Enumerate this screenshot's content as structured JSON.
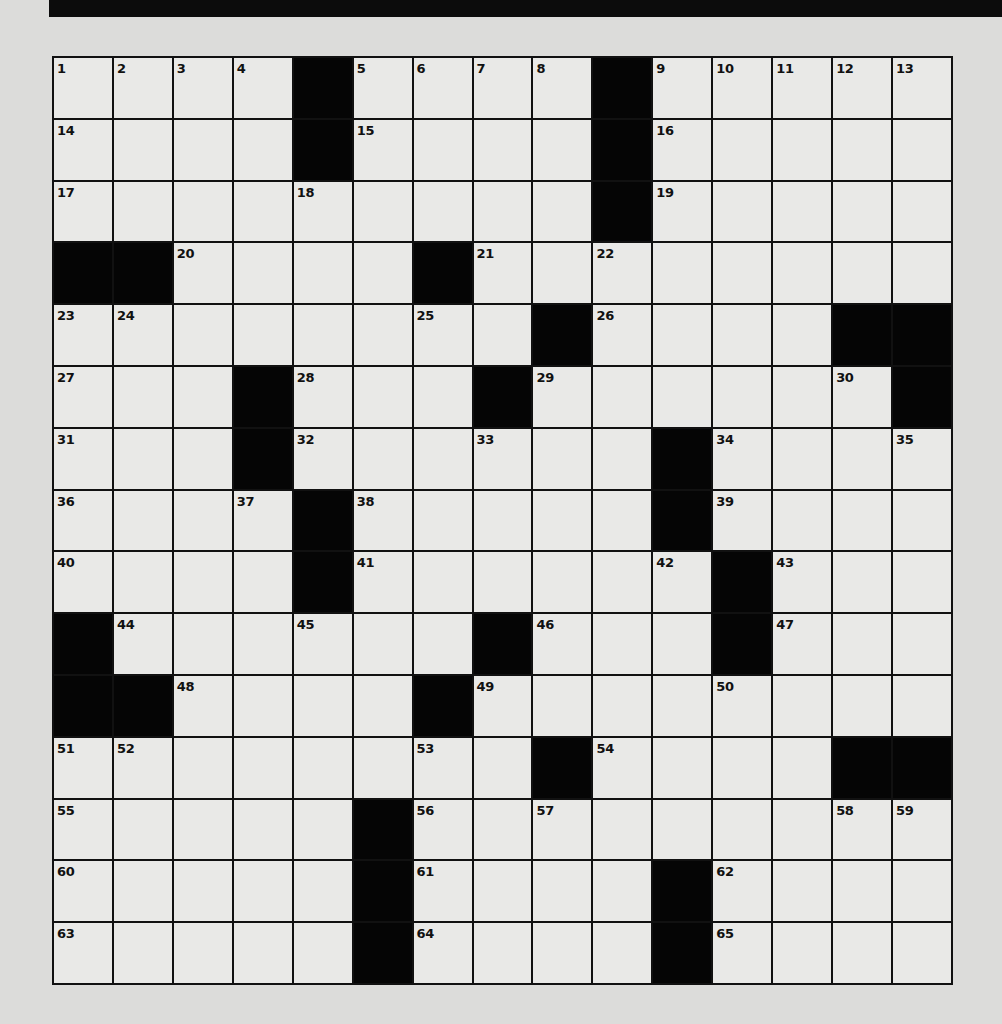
{
  "puzzle": {
    "rows": 15,
    "cols": 15,
    "layout": [
      "....#....#.....",
      "....#....#.....",
      ".........#.....",
      "##....#........",
      "........#....##",
      "...#...#......#",
      "...#......#....",
      "....#.....#....",
      "....#......#...",
      "#......#...#...",
      "##....#........",
      "........#....##",
      ".....#.........",
      ".....#....#....",
      ".....#....#...."
    ],
    "numbers": [
      {
        "r": 0,
        "c": 0,
        "n": "1"
      },
      {
        "r": 0,
        "c": 1,
        "n": "2"
      },
      {
        "r": 0,
        "c": 2,
        "n": "3"
      },
      {
        "r": 0,
        "c": 3,
        "n": "4"
      },
      {
        "r": 0,
        "c": 5,
        "n": "5"
      },
      {
        "r": 0,
        "c": 6,
        "n": "6"
      },
      {
        "r": 0,
        "c": 7,
        "n": "7"
      },
      {
        "r": 0,
        "c": 8,
        "n": "8"
      },
      {
        "r": 0,
        "c": 10,
        "n": "9"
      },
      {
        "r": 0,
        "c": 11,
        "n": "10"
      },
      {
        "r": 0,
        "c": 12,
        "n": "11"
      },
      {
        "r": 0,
        "c": 13,
        "n": "12"
      },
      {
        "r": 0,
        "c": 14,
        "n": "13"
      },
      {
        "r": 1,
        "c": 0,
        "n": "14"
      },
      {
        "r": 1,
        "c": 5,
        "n": "15"
      },
      {
        "r": 1,
        "c": 10,
        "n": "16"
      },
      {
        "r": 2,
        "c": 0,
        "n": "17"
      },
      {
        "r": 2,
        "c": 4,
        "n": "18"
      },
      {
        "r": 2,
        "c": 10,
        "n": "19"
      },
      {
        "r": 3,
        "c": 2,
        "n": "20"
      },
      {
        "r": 3,
        "c": 7,
        "n": "21"
      },
      {
        "r": 3,
        "c": 9,
        "n": "22"
      },
      {
        "r": 4,
        "c": 0,
        "n": "23"
      },
      {
        "r": 4,
        "c": 1,
        "n": "24"
      },
      {
        "r": 4,
        "c": 6,
        "n": "25"
      },
      {
        "r": 4,
        "c": 9,
        "n": "26"
      },
      {
        "r": 5,
        "c": 0,
        "n": "27"
      },
      {
        "r": 5,
        "c": 4,
        "n": "28"
      },
      {
        "r": 5,
        "c": 8,
        "n": "29"
      },
      {
        "r": 5,
        "c": 13,
        "n": "30"
      },
      {
        "r": 6,
        "c": 0,
        "n": "31"
      },
      {
        "r": 6,
        "c": 4,
        "n": "32"
      },
      {
        "r": 6,
        "c": 7,
        "n": "33"
      },
      {
        "r": 6,
        "c": 11,
        "n": "34"
      },
      {
        "r": 6,
        "c": 14,
        "n": "35"
      },
      {
        "r": 7,
        "c": 0,
        "n": "36"
      },
      {
        "r": 7,
        "c": 3,
        "n": "37"
      },
      {
        "r": 7,
        "c": 5,
        "n": "38"
      },
      {
        "r": 7,
        "c": 11,
        "n": "39"
      },
      {
        "r": 8,
        "c": 0,
        "n": "40"
      },
      {
        "r": 8,
        "c": 5,
        "n": "41"
      },
      {
        "r": 8,
        "c": 10,
        "n": "42"
      },
      {
        "r": 8,
        "c": 12,
        "n": "43"
      },
      {
        "r": 9,
        "c": 1,
        "n": "44"
      },
      {
        "r": 9,
        "c": 4,
        "n": "45"
      },
      {
        "r": 9,
        "c": 8,
        "n": "46"
      },
      {
        "r": 9,
        "c": 12,
        "n": "47"
      },
      {
        "r": 10,
        "c": 2,
        "n": "48"
      },
      {
        "r": 10,
        "c": 7,
        "n": "49"
      },
      {
        "r": 10,
        "c": 11,
        "n": "50"
      },
      {
        "r": 11,
        "c": 0,
        "n": "51"
      },
      {
        "r": 11,
        "c": 1,
        "n": "52"
      },
      {
        "r": 11,
        "c": 6,
        "n": "53"
      },
      {
        "r": 11,
        "c": 9,
        "n": "54"
      },
      {
        "r": 12,
        "c": 0,
        "n": "55"
      },
      {
        "r": 12,
        "c": 6,
        "n": "56"
      },
      {
        "r": 12,
        "c": 8,
        "n": "57"
      },
      {
        "r": 12,
        "c": 13,
        "n": "58"
      },
      {
        "r": 12,
        "c": 14,
        "n": "59"
      },
      {
        "r": 13,
        "c": 0,
        "n": "60"
      },
      {
        "r": 13,
        "c": 6,
        "n": "61"
      },
      {
        "r": 13,
        "c": 11,
        "n": "62"
      },
      {
        "r": 14,
        "c": 0,
        "n": "63"
      },
      {
        "r": 14,
        "c": 6,
        "n": "64"
      },
      {
        "r": 14,
        "c": 11,
        "n": "65"
      }
    ],
    "letters": []
  },
  "colors": {
    "paper": "#dcdcda",
    "cell": "#e9e9e7",
    "block": "#050505",
    "line": "#111111",
    "header_bar": "#0c0c0c"
  }
}
